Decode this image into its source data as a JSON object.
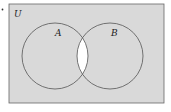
{
  "diagram": {
    "type": "venn",
    "universe_label": "U",
    "sets": [
      {
        "name": "A",
        "label": "A"
      },
      {
        "name": "B",
        "label": "B"
      }
    ],
    "shaded_regions": [
      "A only",
      "B only",
      "outside A and B"
    ],
    "unshaded_regions": [
      "A ∩ B"
    ],
    "colors": {
      "shade": "#d9d9d9",
      "unshaded": "#ffffff",
      "stroke": "#555555"
    }
  }
}
